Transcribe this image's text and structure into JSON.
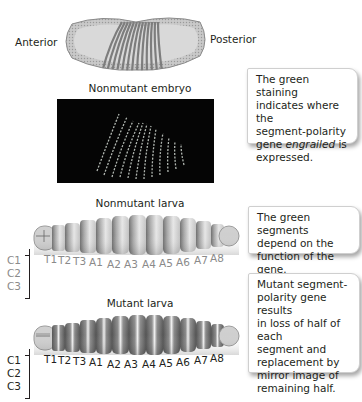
{
  "embryo_drawing": {
    "anterior_label": "Anterior",
    "posterior_label": "Posterior"
  },
  "nonmutant_embryo": {
    "title": "Nonmutant embryo",
    "callout": {
      "line1": "The green staining",
      "line2": "indicates where the",
      "line3": "segment-polarity",
      "line4_prefix": "gene ",
      "line4_italic": "engrailed",
      "line4_suffix": " is",
      "line5": "expressed."
    }
  },
  "nonmutant_larva": {
    "title": "Nonmutant larva",
    "callout": {
      "line1": "The green segments",
      "line2": "depend on the",
      "line3": "function of the gene."
    },
    "head_labels": [
      "C1",
      "C2",
      "C3"
    ],
    "segment_labels": [
      "T1",
      "T2",
      "T3",
      "A1",
      "A2",
      "A3",
      "A4",
      "A5",
      "A6",
      "A7",
      "A8"
    ]
  },
  "mutant_larva": {
    "title": "Mutant larva",
    "callout": {
      "line1": "Mutant segment-",
      "line2": "polarity gene results",
      "line3": "in loss of half of each",
      "line4": "segment and",
      "line5": "replacement by",
      "line6": "mirror image of",
      "line7": "remaining half."
    },
    "head_labels": [
      "C1",
      "C2",
      "C3"
    ],
    "segment_labels": [
      "T1",
      "T2",
      "T3",
      "A1",
      "A2",
      "A3",
      "A4",
      "A5",
      "A6",
      "A7",
      "A8"
    ]
  },
  "colors": {
    "text": "#231f20",
    "label_gray": "#8a8a8a",
    "callout_border": "#cfcfcf"
  }
}
